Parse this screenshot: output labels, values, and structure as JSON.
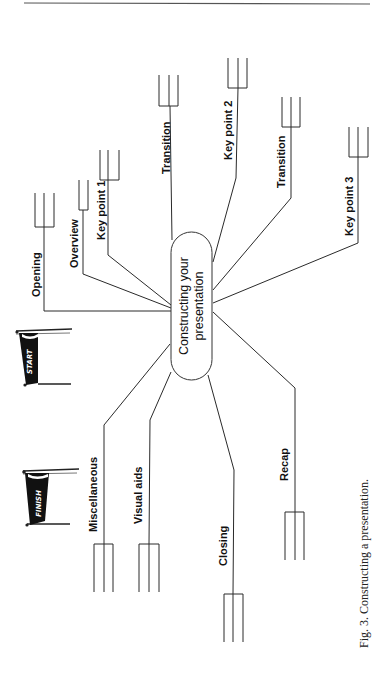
{
  "figure": {
    "caption": "Fig. 3.  Constructing a presentation.",
    "center_node": {
      "line1": "Constructing your",
      "line2": "presentation"
    },
    "branches": [
      {
        "id": "opening",
        "label": "Opening"
      },
      {
        "id": "overview",
        "label": "Overview"
      },
      {
        "id": "key-point-1",
        "label": "Key point 1"
      },
      {
        "id": "transition-1",
        "label": "Transition"
      },
      {
        "id": "key-point-2",
        "label": "Key point 2"
      },
      {
        "id": "transition-2",
        "label": "Transition"
      },
      {
        "id": "key-point-3",
        "label": "Key point 3"
      },
      {
        "id": "recap",
        "label": "Recap"
      },
      {
        "id": "closing",
        "label": "Closing"
      },
      {
        "id": "visual-aids",
        "label": "Visual aids"
      },
      {
        "id": "miscellaneous",
        "label": "Miscellaneous"
      }
    ],
    "flags": {
      "start": "START",
      "finish": "FINISH"
    }
  }
}
